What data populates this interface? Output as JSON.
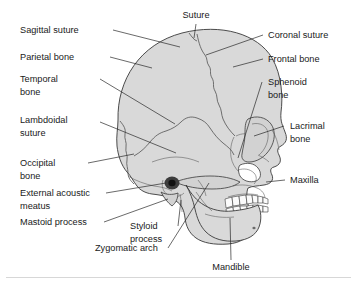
{
  "figure": {
    "type": "anatomical-diagram",
    "background_color": "#ffffff",
    "bone_fill_color": "#d9d9d9",
    "outline_color": "#3a3a3a",
    "leader_line_color": "#2a2a2a",
    "text_color": "#1a1a1a"
  },
  "labels": {
    "sagittal_suture": "Sagittal suture",
    "parietal_bone": "Parietal bone",
    "temporal_bone_line1": "Temporal",
    "temporal_bone_line2": "bone",
    "lambdoidal_suture_line1": "Lambdoidal",
    "lambdoidal_suture_line2": "suture",
    "occipital_bone_line1": "Occipital",
    "occipital_bone_line2": "bone",
    "external_acoustic_meatus_line1": "External acoustic",
    "external_acoustic_meatus_line2": "meatus",
    "mastoid_process": "Mastoid process",
    "styloid_process_line1": "Styloid",
    "styloid_process_line2": "process",
    "zygomatic_arch": "Zygomatic arch",
    "suture": "Suture",
    "coronal_suture": "Coronal suture",
    "frontal_bone": "Frontal bone",
    "sphenoid_bone_line1": "Sphenoid",
    "sphenoid_bone_line2": "bone",
    "lacrimal_bone_line1": "Lacrimal",
    "lacrimal_bone_line2": "bone",
    "maxilla": "Maxilla",
    "mandible": "Mandible"
  }
}
